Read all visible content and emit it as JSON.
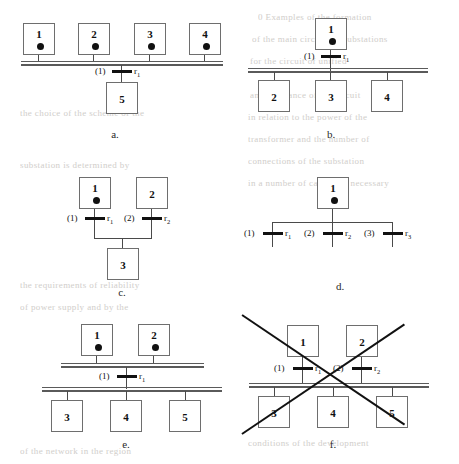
{
  "figure": {
    "panels": [
      {
        "id": "a",
        "caption": "a.",
        "top_boxes": [
          {
            "label": "1",
            "has_source_dot": true
          },
          {
            "label": "2",
            "has_source_dot": true
          },
          {
            "label": "3",
            "has_source_dot": true
          },
          {
            "label": "4",
            "has_source_dot": true
          }
        ],
        "bottom_boxes": [
          {
            "label": "5",
            "has_source_dot": false
          }
        ],
        "branches": [
          {
            "number": "(1)",
            "resistor": "r",
            "sub": "1"
          }
        ]
      },
      {
        "id": "b",
        "caption": "b.",
        "top_boxes": [
          {
            "label": "1",
            "has_source_dot": true
          }
        ],
        "bottom_boxes": [
          {
            "label": "2",
            "has_source_dot": false
          },
          {
            "label": "3",
            "has_source_dot": false
          },
          {
            "label": "4",
            "has_source_dot": false
          }
        ],
        "branches": [
          {
            "number": "(1)",
            "resistor": "r",
            "sub": "1"
          }
        ]
      },
      {
        "id": "c",
        "caption": "c.",
        "top_boxes": [
          {
            "label": "1",
            "has_source_dot": true
          },
          {
            "label": "2",
            "has_source_dot": false
          }
        ],
        "bottom_boxes": [
          {
            "label": "3",
            "has_source_dot": false
          }
        ],
        "branches": [
          {
            "number": "(1)",
            "resistor": "r",
            "sub": "1"
          },
          {
            "number": "(2)",
            "resistor": "r",
            "sub": "2"
          }
        ]
      },
      {
        "id": "d",
        "caption": "d.",
        "top_boxes": [
          {
            "label": "1",
            "has_source_dot": true
          }
        ],
        "bottom_boxes": [],
        "branches": [
          {
            "number": "(1)",
            "resistor": "r",
            "sub": "1"
          },
          {
            "number": "(2)",
            "resistor": "r",
            "sub": "2"
          },
          {
            "number": "(3)",
            "resistor": "r",
            "sub": "3"
          }
        ]
      },
      {
        "id": "e",
        "caption": "e.",
        "top_boxes": [
          {
            "label": "1",
            "has_source_dot": true
          },
          {
            "label": "2",
            "has_source_dot": true
          }
        ],
        "bottom_boxes": [
          {
            "label": "3",
            "has_source_dot": false
          },
          {
            "label": "4",
            "has_source_dot": false
          },
          {
            "label": "5",
            "has_source_dot": false
          }
        ],
        "branches": [
          {
            "number": "(1)",
            "resistor": "r",
            "sub": "1"
          }
        ]
      },
      {
        "id": "f",
        "caption": "f.",
        "crossed_out": true,
        "top_boxes": [
          {
            "label": "1",
            "has_source_dot": false
          },
          {
            "label": "2",
            "has_source_dot": false
          }
        ],
        "bottom_boxes": [
          {
            "label": "3",
            "has_source_dot": false
          },
          {
            "label": "4",
            "has_source_dot": false
          },
          {
            "label": "5",
            "has_source_dot": false
          }
        ],
        "branches": [
          {
            "number": "(1)",
            "resistor": "r",
            "sub": "1"
          },
          {
            "number": "(2)",
            "resistor": "r",
            "sub": "2"
          }
        ]
      }
    ]
  },
  "colors": {
    "ink": "#111111",
    "wire": "#4a4a4a",
    "box_border": "#6e6e6e",
    "bus": "#5a5a5a",
    "paper": "#ffffff",
    "ghost_text": "#c9c6c2"
  },
  "bleed_text": {
    "lines": [
      "0 Examples of the formation",
      "of the main circuits of substations",
      "for the circuit of unified",
      "and resistance of the circuit",
      "in relation to the power of the",
      "transformer and the number of",
      "connections of the substation",
      "in a number of cases it is necessary",
      "the choice of the scheme of the",
      "substation is determined by",
      "the requirements of reliability",
      "of power supply and by the",
      "conditions of the development",
      "of the network in the region"
    ]
  }
}
